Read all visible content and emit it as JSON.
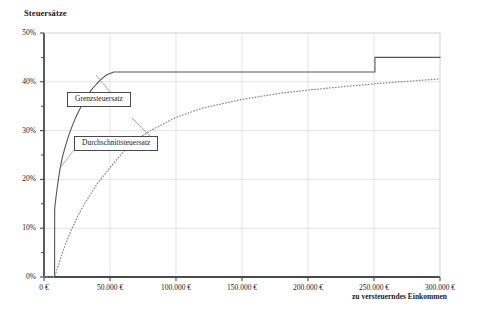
{
  "chart": {
    "title": "Steuersätze",
    "xlabel": "zu versteuerndes Einkommen",
    "ylabel": "",
    "callouts": {
      "marginal": "Grenzsteuersatz",
      "average": "Durchschnittsteuersatz"
    }
  },
  "axis": {
    "y_ticks": [
      "0%",
      "10%",
      "20%",
      "30%",
      "40%",
      "50%"
    ],
    "x_ticks": [
      "0 €",
      "50.000 €",
      "100.000 €",
      "150.000 €",
      "200.000 €",
      "250.000 €",
      "300.000 €"
    ]
  },
  "colors": {
    "frame": "#4a4a4a",
    "grid": "#d9d9d9",
    "marginal_line": "#555555",
    "average_line": "#8c8c8c",
    "text": "#1a1a1a",
    "background": "#ffffff"
  },
  "chart_data": {
    "type": "line",
    "title": "Steuersätze",
    "xlabel": "zu versteuerndes Einkommen",
    "ylabel": "Steuersätze",
    "xlim": [
      0,
      300000
    ],
    "ylim": [
      0,
      50
    ],
    "xticks": [
      0,
      50000,
      100000,
      150000,
      200000,
      250000,
      300000
    ],
    "xticklabels": [
      "0 €",
      "50.000 €",
      "100.000 €",
      "150.000 €",
      "200.000 €",
      "250.000 €",
      "300.000 €"
    ],
    "yticks": [
      0,
      10,
      20,
      30,
      40,
      50
    ],
    "yticklabels": [
      "0%",
      "10%",
      "20%",
      "30%",
      "40%",
      "50%"
    ],
    "yminorticks": [
      5,
      15,
      25,
      35,
      45
    ],
    "grid": true,
    "legend": "annotations",
    "units": {
      "x": "EUR",
      "y": "percent"
    },
    "series": [
      {
        "name": "Grenzsteuersatz",
        "label": "Grenzsteuersatz",
        "style": "solid",
        "color": "#555555",
        "x": [
          0,
          8004,
          8100,
          9000,
          10000,
          11000,
          12000,
          13469,
          14000,
          16000,
          18000,
          20000,
          24000,
          28000,
          32000,
          36000,
          40000,
          44000,
          48000,
          52882,
          60000,
          80000,
          100000,
          150000,
          200000,
          250730,
          250731,
          260000,
          280000,
          300000
        ],
        "y": [
          0,
          0,
          14.0,
          16.2,
          18.3,
          20.2,
          21.9,
          23.97,
          24.6,
          26.6,
          28.4,
          30.0,
          32.7,
          34.9,
          36.7,
          38.4,
          39.6,
          40.7,
          41.5,
          42.0,
          42.0,
          42.0,
          42.0,
          42.0,
          42.0,
          42.0,
          45.0,
          45.0,
          45.0,
          45.0
        ]
      },
      {
        "name": "Durchschnittsteuersatz",
        "label": "Durchschnittsteuersatz",
        "style": "dotted",
        "color": "#8c8c8c",
        "x": [
          0,
          8004,
          9000,
          10000,
          12000,
          14000,
          16000,
          20000,
          25000,
          30000,
          40000,
          50000,
          60000,
          70000,
          80000,
          100000,
          120000,
          150000,
          180000,
          200000,
          230000,
          250730,
          270000,
          300000
        ],
        "y": [
          0,
          0,
          0.8,
          1.7,
          3.4,
          5.0,
          6.5,
          9.2,
          12.2,
          14.7,
          19.0,
          22.4,
          25.6,
          28.0,
          29.9,
          32.7,
          34.6,
          36.4,
          37.7,
          38.3,
          39.1,
          39.6,
          40.0,
          40.6
        ]
      }
    ],
    "annotations": [
      {
        "text": "Grenzsteuersatz",
        "x": 33000,
        "y": 37.0,
        "boxed": true
      },
      {
        "text": "Durchschnittsteuersatz",
        "x": 48000,
        "y": 28.5,
        "boxed": true
      }
    ]
  }
}
